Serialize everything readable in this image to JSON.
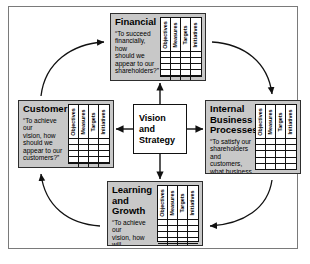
{
  "diagram": {
    "center": {
      "label": "Vision\nand\nStrategy"
    },
    "table_headers": [
      "Objectives",
      "Measures",
      "Targets",
      "Initiatives"
    ],
    "table_body_rows": 5,
    "perspectives": [
      {
        "id": "financial",
        "title": "Financial",
        "question": "“To succeed\nfinancially, how\nshould we\nappear to our\nshareholders?”"
      },
      {
        "id": "customer",
        "title": "Customer",
        "question": "“To achieve our\nvision, how\nshould we\nappear to our\ncustomers?”"
      },
      {
        "id": "internal",
        "title": "Internal Business\nProcesses",
        "question": "“To satisfy our\nshareholders\nand customers,\nwhat business\nprocesses must\nwe excel at?”"
      },
      {
        "id": "learning",
        "title": "Learning and\nGrowth",
        "question": "“To achieve our\nvision, how will\nwe sustain our\nability to\nchange and\nimprove?”"
      }
    ],
    "colors": {
      "box_fill": "#c8c8c8",
      "box_border": "#2e2e2e",
      "center_fill": "#ffffff",
      "frame_border": "#7a7a7a",
      "arrow": "#111111",
      "text": "#000000"
    }
  }
}
